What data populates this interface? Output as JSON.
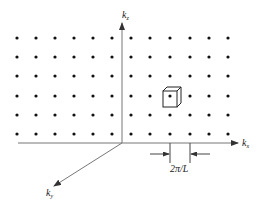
{
  "figure": {
    "axes": {
      "kx": {
        "label": "k",
        "subscript": "x"
      },
      "ky": {
        "label": "k",
        "subscript": "y"
      },
      "kz": {
        "label": "k",
        "subscript": "z"
      }
    },
    "spacing_label": "2π/L",
    "lattice": {
      "columns_x": [
        17,
        36,
        55,
        74,
        93,
        112,
        131,
        150,
        170,
        190,
        209,
        228
      ],
      "rows_y": [
        38,
        57,
        76,
        96,
        115,
        134
      ],
      "dot_radius": 1.6,
      "dot_color": "#111111"
    },
    "unit_cell_highlight": {
      "front": [
        163,
        91,
        14,
        17
      ],
      "offset": [
        4,
        -4
      ]
    },
    "colors": {
      "axis": "#666666",
      "ink": "#222222",
      "background": "#ffffff"
    }
  }
}
